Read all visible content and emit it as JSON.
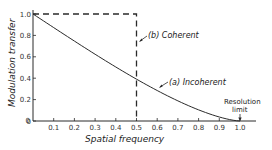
{
  "chart_data": {
    "type": "line",
    "title": "",
    "xlabel": "Spatial frequency",
    "ylabel": "Modulation transfer",
    "xlim": [
      0,
      1.07
    ],
    "ylim": [
      0,
      1.0
    ],
    "x_ticks": [
      "0",
      "0.1",
      "0.2",
      "0.3",
      "0.4",
      "0.5",
      "0.6",
      "0.7",
      "0.8",
      "0.9",
      "1.0"
    ],
    "y_ticks": [
      "0",
      "0.2",
      "0.4",
      "0.6",
      "0.8",
      "1.0"
    ],
    "grid": false,
    "series": [
      {
        "name": "(a) Incoherent",
        "style": "solid",
        "x": [
          0,
          0.1,
          0.2,
          0.3,
          0.4,
          0.5,
          0.6,
          0.7,
          0.8,
          0.9,
          1.0
        ],
        "values": [
          1.0,
          0.873,
          0.747,
          0.624,
          0.505,
          0.391,
          0.285,
          0.188,
          0.104,
          0.036,
          0.0
        ]
      },
      {
        "name": "(b) Coherent",
        "style": "dashed",
        "x": [
          0,
          0.5,
          0.5
        ],
        "values": [
          1.0,
          1.0,
          0.0
        ]
      }
    ],
    "annotations": [
      {
        "text": "(b) Coherent",
        "target": "coherent curve"
      },
      {
        "text": "(a) Incoherent",
        "target": "incoherent curve"
      },
      {
        "text": "Resolution limit",
        "x": 1.0,
        "y": 0.0
      }
    ]
  },
  "labels": {
    "xlabel": "Spatial frequency",
    "ylabel": "Modulation transfer",
    "coherent": "(b) Coherent",
    "incoherent": "(a) Incoherent",
    "resolution_line1": "Resolution",
    "resolution_line2": "limit"
  },
  "colors": {
    "ink": "#2a2a2a"
  }
}
